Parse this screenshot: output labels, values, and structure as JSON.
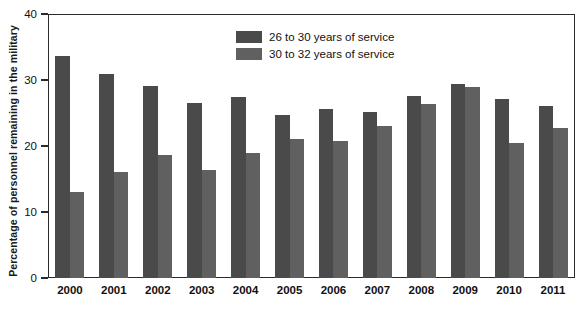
{
  "chart_data": {
    "type": "bar",
    "title": "",
    "xlabel": "",
    "ylabel": "Percentage of personnel remaining in the military",
    "ylim": [
      0,
      40
    ],
    "yticks": [
      0,
      10,
      20,
      30,
      40
    ],
    "ytick_labels": [
      "0",
      "10",
      "20",
      "30",
      "40"
    ],
    "grid": false,
    "legend_position": "top-center",
    "categories": [
      "2000",
      "2001",
      "2002",
      "2003",
      "2004",
      "2005",
      "2006",
      "2007",
      "2008",
      "2009",
      "2010",
      "2011"
    ],
    "series": [
      {
        "name": "26 to 30 years of service",
        "color": "#4a4a4a",
        "values": [
          33.7,
          30.9,
          29.1,
          26.5,
          27.4,
          24.7,
          25.6,
          25.2,
          27.6,
          29.4,
          27.1,
          26.0
        ]
      },
      {
        "name": "30 to 32 years of service",
        "color": "#606060",
        "values": [
          13.1,
          16.1,
          18.6,
          16.3,
          18.9,
          21.0,
          20.7,
          23.0,
          26.3,
          29.0,
          20.5,
          22.7
        ]
      }
    ]
  },
  "legend": {
    "items": [
      {
        "label": "26 to 30 years of service",
        "color": "#4a4a4a"
      },
      {
        "label": "30 to 32 years of service",
        "color": "#606060"
      }
    ]
  },
  "axes": {
    "y_title": "Percentage of personnel remaining in the military",
    "y_max": 40,
    "y_min": 0
  }
}
